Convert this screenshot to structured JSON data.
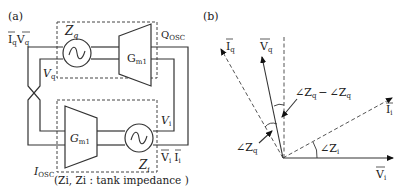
{
  "panel_a": {
    "label": "(a)",
    "top_block": {
      "impedance": "Z",
      "impedance_sub": "q",
      "amp": "G",
      "amp_sub": "m1"
    },
    "bottom_block": {
      "impedance": "Z",
      "impedance_sub": "i",
      "amp": "G",
      "amp_sub": "m1"
    },
    "labels": {
      "iq_vq_I": "I",
      "iq_vq_Isub": "q",
      "iq_vq_V": "V",
      "iq_vq_Vsub": "q",
      "vq": "V",
      "vq_sub": "q",
      "qosc": "Q",
      "qosc_sub": "OSC",
      "vi": "V",
      "vi_sub": "i",
      "vi_ii_V": "V",
      "vi_ii_Vsub": "i",
      "vi_ii_I": "I",
      "vi_ii_Isub": "i",
      "iosc": "I",
      "iosc_sub": "OSC"
    },
    "caption": "(Zi, Zi : tank impedance )"
  },
  "panel_b": {
    "label": "(b)",
    "vectors": {
      "iq": {
        "name": "I",
        "sub": "q"
      },
      "vq": {
        "name": "V",
        "sub": "q"
      },
      "ii": {
        "name": "I",
        "sub": "i"
      },
      "vi": {
        "name": "V",
        "sub": "i"
      }
    },
    "angles": {
      "diff": "∠Z_q − ∠Z_q",
      "diff_a": "∠Z",
      "diff_a_sub": "q",
      "minus": "−",
      "diff_b": "∠Z",
      "diff_b_sub": "q",
      "zq": "∠Z",
      "zq_sub": "q",
      "zi": "∠Z",
      "zi_sub": "i"
    }
  }
}
